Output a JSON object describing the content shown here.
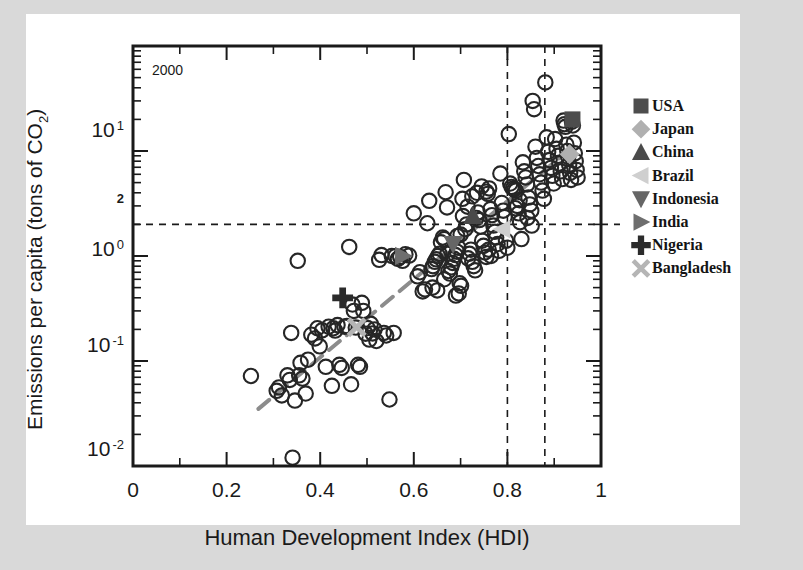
{
  "figure": {
    "annotation": "2000",
    "background": "#d9d9d9",
    "page_background": "#ffffff"
  },
  "chart_data": {
    "type": "scatter",
    "title": "",
    "annotation": "2000",
    "xlabel": "Human Development Index (HDI)",
    "ylabel": "Emissions per capita (tons of CO2)",
    "ylabel_parts": {
      "main": "Emissions per capita (tons of CO",
      "sub": "2",
      "tail": ")"
    },
    "xlim": [
      0,
      1
    ],
    "ylim": [
      0.01,
      100
    ],
    "yscale": "log",
    "xscale": "linear",
    "grid": false,
    "legend_position": "right-outside",
    "xticks": [
      {
        "value": 0,
        "label": "0"
      },
      {
        "value": 0.2,
        "label": "0.2"
      },
      {
        "value": 0.4,
        "label": "0.4"
      },
      {
        "value": 0.6,
        "label": "0.6"
      },
      {
        "value": 0.8,
        "label": "0.8"
      },
      {
        "value": 1,
        "label": "1"
      }
    ],
    "xminor_ticks": [
      0.1,
      0.3,
      0.5,
      0.7,
      0.9
    ],
    "yticks": [
      {
        "value": 10,
        "mantissa": "10",
        "exponent": "1"
      },
      {
        "value": 1,
        "mantissa": "10",
        "exponent": "0"
      },
      {
        "value": 0.1,
        "mantissa": "10",
        "exponent": "-1"
      },
      {
        "value": 0.01,
        "mantissa": "10",
        "exponent": "-2"
      }
    ],
    "yspecial_tick": {
      "value": 2,
      "label": "2"
    },
    "reference_lines": [
      {
        "orientation": "horizontal",
        "value": 2,
        "style": "dashed"
      },
      {
        "orientation": "vertical",
        "value": 0.8,
        "style": "dashed"
      },
      {
        "orientation": "vertical",
        "value": 0.88,
        "style": "dashed"
      }
    ],
    "trend_line": {
      "style": "dashed",
      "color": "#8c8c8c",
      "x0": 0.268,
      "y0": 0.035,
      "x1": 0.945,
      "y1": 11.5
    },
    "legend": [
      {
        "label": "USA",
        "marker": "square",
        "color": "#4d4d4d"
      },
      {
        "label": "Japan",
        "marker": "diamond",
        "color": "#b0b0b0"
      },
      {
        "label": "China",
        "marker": "triangle-up",
        "color": "#4a4a4a"
      },
      {
        "label": "Brazil",
        "marker": "triangle-left",
        "color": "#cfcfcf"
      },
      {
        "label": "Indonesia",
        "marker": "triangle-down",
        "color": "#666666"
      },
      {
        "label": "India",
        "marker": "triangle-right",
        "color": "#6e6e6e"
      },
      {
        "label": "Nigeria",
        "marker": "plus",
        "color": "#2b2b2b"
      },
      {
        "label": "Bangladesh",
        "marker": "cross",
        "color": "#b5b5b5"
      }
    ],
    "highlighted_countries": [
      {
        "name": "USA",
        "hdi": 0.939,
        "emissions": 20.0,
        "marker": "square",
        "color": "#4d4d4d"
      },
      {
        "name": "Japan",
        "hdi": 0.933,
        "emissions": 9.3,
        "marker": "diamond",
        "color": "#b0b0b0"
      },
      {
        "name": "China",
        "hdi": 0.726,
        "emissions": 2.4,
        "marker": "triangle-up",
        "color": "#4a4a4a"
      },
      {
        "name": "Brazil",
        "hdi": 0.789,
        "emissions": 1.8,
        "marker": "triangle-left",
        "color": "#cfcfcf"
      },
      {
        "name": "Indonesia",
        "hdi": 0.684,
        "emissions": 1.3,
        "marker": "triangle-down",
        "color": "#666666"
      },
      {
        "name": "India",
        "hdi": 0.577,
        "emissions": 1.0,
        "marker": "triangle-right",
        "color": "#6e6e6e"
      },
      {
        "name": "Nigeria",
        "hdi": 0.448,
        "emissions": 0.4,
        "marker": "plus",
        "color": "#2b2b2b"
      },
      {
        "name": "Bangladesh",
        "hdi": 0.478,
        "emissions": 0.21,
        "marker": "cross",
        "color": "#b5b5b5"
      }
    ],
    "points": [
      [
        0.252,
        0.072
      ],
      [
        0.307,
        0.052
      ],
      [
        0.312,
        0.056
      ],
      [
        0.318,
        0.047
      ],
      [
        0.33,
        0.073
      ],
      [
        0.335,
        0.066
      ],
      [
        0.338,
        0.185
      ],
      [
        0.341,
        0.012
      ],
      [
        0.346,
        0.042
      ],
      [
        0.352,
        0.9
      ],
      [
        0.355,
        0.073
      ],
      [
        0.358,
        0.096
      ],
      [
        0.362,
        0.068
      ],
      [
        0.369,
        0.049
      ],
      [
        0.374,
        0.103
      ],
      [
        0.381,
        0.178
      ],
      [
        0.389,
        0.164
      ],
      [
        0.394,
        0.205
      ],
      [
        0.399,
        0.138
      ],
      [
        0.404,
        0.196
      ],
      [
        0.412,
        0.088
      ],
      [
        0.418,
        0.212
      ],
      [
        0.425,
        0.058
      ],
      [
        0.428,
        0.205
      ],
      [
        0.432,
        0.195
      ],
      [
        0.437,
        0.22
      ],
      [
        0.441,
        0.092
      ],
      [
        0.446,
        0.086
      ],
      [
        0.452,
        0.212
      ],
      [
        0.457,
        0.215
      ],
      [
        0.462,
        1.22
      ],
      [
        0.466,
        0.06
      ],
      [
        0.469,
        0.345
      ],
      [
        0.472,
        0.3
      ],
      [
        0.476,
        0.208
      ],
      [
        0.481,
        0.092
      ],
      [
        0.485,
        0.088
      ],
      [
        0.489,
        0.358
      ],
      [
        0.492,
        0.3
      ],
      [
        0.497,
        0.182
      ],
      [
        0.501,
        0.206
      ],
      [
        0.505,
        0.16
      ],
      [
        0.508,
        0.226
      ],
      [
        0.512,
        0.183
      ],
      [
        0.516,
        0.2
      ],
      [
        0.52,
        0.155
      ],
      [
        0.526,
        0.92
      ],
      [
        0.531,
        1.02
      ],
      [
        0.536,
        0.185
      ],
      [
        0.541,
        0.175
      ],
      [
        0.548,
        0.043
      ],
      [
        0.553,
        1.0
      ],
      [
        0.557,
        0.185
      ],
      [
        0.561,
        0.996
      ],
      [
        0.566,
        0.94
      ],
      [
        0.571,
        0.98
      ],
      [
        0.576,
        0.9
      ],
      [
        0.582,
        1.04
      ],
      [
        0.59,
        1.01
      ],
      [
        0.6,
        2.55
      ],
      [
        0.608,
        0.64
      ],
      [
        0.613,
        0.7
      ],
      [
        0.619,
        0.46
      ],
      [
        0.624,
        0.48
      ],
      [
        0.629,
        2.05
      ],
      [
        0.633,
        3.35
      ],
      [
        0.638,
        0.75
      ],
      [
        0.641,
        0.8
      ],
      [
        0.645,
        0.88
      ],
      [
        0.648,
        0.93
      ],
      [
        0.652,
        1.0
      ],
      [
        0.655,
        1.05
      ],
      [
        0.658,
        1.35
      ],
      [
        0.662,
        1.5
      ],
      [
        0.665,
        0.6
      ],
      [
        0.668,
        4.05
      ],
      [
        0.671,
        2.9
      ],
      [
        0.674,
        0.72
      ],
      [
        0.677,
        0.68
      ],
      [
        0.68,
        0.78
      ],
      [
        0.683,
        0.86
      ],
      [
        0.686,
        0.94
      ],
      [
        0.689,
        1.02
      ],
      [
        0.692,
        1.1
      ],
      [
        0.695,
        1.2
      ],
      [
        0.698,
        0.55
      ],
      [
        0.701,
        0.52
      ],
      [
        0.704,
        3.5
      ],
      [
        0.707,
        5.3
      ],
      [
        0.71,
        1.8
      ],
      [
        0.713,
        2.0
      ],
      [
        0.716,
        0.95
      ],
      [
        0.719,
        1.05
      ],
      [
        0.722,
        1.15
      ],
      [
        0.725,
        0.88
      ],
      [
        0.728,
        0.8
      ],
      [
        0.731,
        0.73
      ],
      [
        0.734,
        2.3
      ],
      [
        0.737,
        2.6
      ],
      [
        0.74,
        2.2
      ],
      [
        0.743,
        1.9
      ],
      [
        0.746,
        1.4
      ],
      [
        0.749,
        1.25
      ],
      [
        0.752,
        1.08
      ],
      [
        0.755,
        0.98
      ],
      [
        0.758,
        3.9
      ],
      [
        0.761,
        4.4
      ],
      [
        0.764,
        2.8
      ],
      [
        0.767,
        2.45
      ],
      [
        0.77,
        1.95
      ],
      [
        0.773,
        1.7
      ],
      [
        0.776,
        1.5
      ],
      [
        0.779,
        1.3
      ],
      [
        0.782,
        1.12
      ],
      [
        0.785,
        6.1
      ],
      [
        0.788,
        3.2
      ],
      [
        0.791,
        2.7
      ],
      [
        0.794,
        2.35
      ],
      [
        0.797,
        1.4
      ],
      [
        0.8,
        1.2
      ],
      [
        0.803,
        14.5
      ],
      [
        0.806,
        4.9
      ],
      [
        0.809,
        4.55
      ],
      [
        0.812,
        4.4
      ],
      [
        0.815,
        4.3
      ],
      [
        0.818,
        4.2
      ],
      [
        0.821,
        3.0
      ],
      [
        0.824,
        2.55
      ],
      [
        0.827,
        2.1
      ],
      [
        0.83,
        1.45
      ],
      [
        0.833,
        7.8
      ],
      [
        0.836,
        6.4
      ],
      [
        0.839,
        5.6
      ],
      [
        0.842,
        4.8
      ],
      [
        0.845,
        3.6
      ],
      [
        0.848,
        3.1
      ],
      [
        0.851,
        2.7
      ],
      [
        0.854,
        30.0
      ],
      [
        0.857,
        25.0
      ],
      [
        0.86,
        11.0
      ],
      [
        0.863,
        8.6
      ],
      [
        0.866,
        7.2
      ],
      [
        0.869,
        6.0
      ],
      [
        0.872,
        5.0
      ],
      [
        0.875,
        4.2
      ],
      [
        0.878,
        3.5
      ],
      [
        0.881,
        45.0
      ],
      [
        0.884,
        13.5
      ],
      [
        0.887,
        9.8
      ],
      [
        0.89,
        8.2
      ],
      [
        0.893,
        6.9
      ],
      [
        0.896,
        5.8
      ],
      [
        0.899,
        4.9
      ],
      [
        0.902,
        13.0
      ],
      [
        0.905,
        10.5
      ],
      [
        0.908,
        9.0
      ],
      [
        0.911,
        7.6
      ],
      [
        0.914,
        6.4
      ],
      [
        0.917,
        5.4
      ],
      [
        0.92,
        19.5
      ],
      [
        0.922,
        18.0
      ],
      [
        0.924,
        17.0
      ],
      [
        0.926,
        11.5
      ],
      [
        0.928,
        10.0
      ],
      [
        0.93,
        8.8
      ],
      [
        0.932,
        7.4
      ],
      [
        0.934,
        6.2
      ],
      [
        0.936,
        5.3
      ],
      [
        0.938,
        19.0
      ],
      [
        0.94,
        17.5
      ],
      [
        0.942,
        12.0
      ],
      [
        0.944,
        9.5
      ],
      [
        0.946,
        8.0
      ],
      [
        0.948,
        6.6
      ],
      [
        0.95,
        5.6
      ],
      [
        0.665,
        1.45
      ],
      [
        0.672,
        1.05
      ],
      [
        0.69,
        0.42
      ],
      [
        0.696,
        0.44
      ],
      [
        0.76,
        1.15
      ],
      [
        0.765,
        1.0
      ],
      [
        0.64,
        0.5
      ],
      [
        0.65,
        0.47
      ],
      [
        0.755,
        4.1
      ],
      [
        0.745,
        4.6
      ],
      [
        0.735,
        4.0
      ],
      [
        0.725,
        3.7
      ],
      [
        0.715,
        2.95
      ],
      [
        0.705,
        2.4
      ],
      [
        0.7,
        1.6
      ],
      [
        0.693,
        1.55
      ],
      [
        0.817,
        2.85
      ],
      [
        0.826,
        3.4
      ],
      [
        0.843,
        2.3
      ],
      [
        0.852,
        1.95
      ]
    ]
  }
}
